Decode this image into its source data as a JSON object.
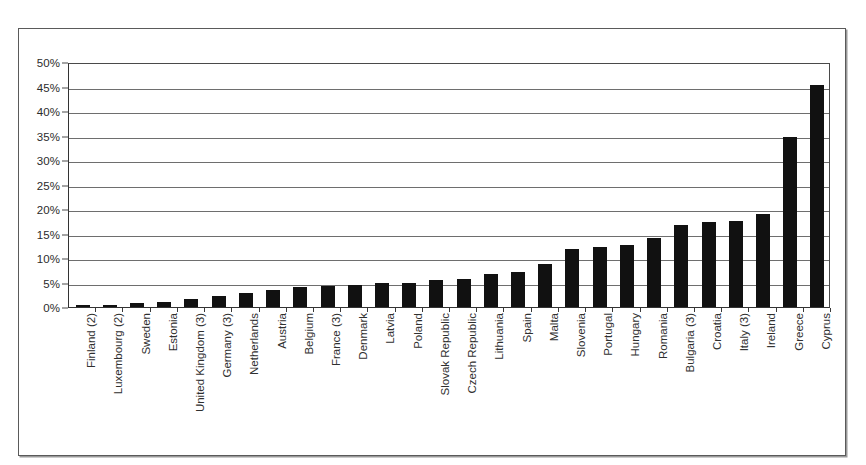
{
  "chart_data": {
    "type": "bar",
    "title": "",
    "subtitle": "",
    "xlabel": "",
    "ylabel": "",
    "ylim": [
      0,
      50
    ],
    "ytick_labels": [
      "0%",
      "5%",
      "10%",
      "15%",
      "20%",
      "25%",
      "30%",
      "35%",
      "40%",
      "45%",
      "50%"
    ],
    "ytick_values": [
      0,
      5,
      10,
      15,
      20,
      25,
      30,
      35,
      40,
      45,
      50
    ],
    "grid": true,
    "legend": "none",
    "bar_color": "#111111",
    "value_unit": "%",
    "categories": [
      "Finland (2)",
      "Luxembourg (2)",
      "Sweden",
      "Estonia",
      "United Kingdom (3)",
      "Germany (3)",
      "Netherlands",
      "Austria",
      "Belgium",
      "France (3)",
      "Denmark",
      "Latvia",
      "Poland",
      "Slovak Republic",
      "Czech Republic",
      "Lithuania",
      "Spain",
      "Malta",
      "Slovenia",
      "Portugal",
      "Hungary",
      "Romania",
      "Bulgaria (3)",
      "Croatia",
      "Italy (3)",
      "Ireland",
      "Greece",
      "Cyprus"
    ],
    "values": [
      0.4,
      0.5,
      0.9,
      1.1,
      1.6,
      2.2,
      2.9,
      3.5,
      4.0,
      4.2,
      4.5,
      4.9,
      5.0,
      5.5,
      5.8,
      6.7,
      7.1,
      8.8,
      11.8,
      12.3,
      12.6,
      14.0,
      16.7,
      17.3,
      17.5,
      19.0,
      34.7,
      45.3
    ]
  }
}
